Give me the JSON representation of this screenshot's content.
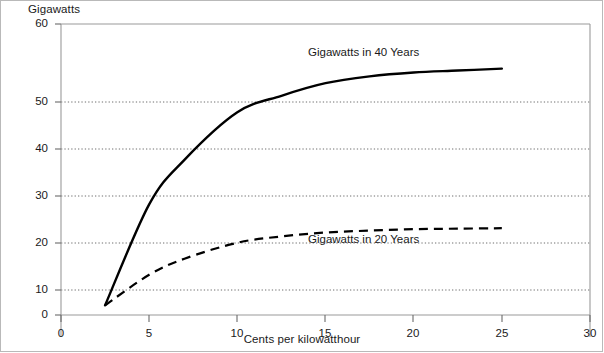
{
  "chart_data": {
    "type": "line",
    "title": "",
    "subtitle": "",
    "xlabel": "Cents per kilowatthour",
    "ylabel": "Gigawatts",
    "xlim": [
      0,
      30
    ],
    "ylim": [
      0,
      60
    ],
    "xticks": [
      0,
      5,
      10,
      15,
      20,
      25,
      30
    ],
    "yticks": [
      0,
      10,
      20,
      30,
      40,
      50,
      60
    ],
    "xtick_labels": [
      "0",
      "5",
      "10",
      "15",
      "20",
      "25",
      "30"
    ],
    "ytick_labels": [
      "0",
      "10",
      "20",
      "30",
      "40",
      "50",
      "60"
    ],
    "grid": "horizontal-dotted",
    "legend": "inline-annotations",
    "series": [
      {
        "name": "Gigawatts in 40 Years",
        "style": "solid",
        "color": "#000000",
        "x": [
          2.5,
          5,
          7,
          10,
          12.5,
          15,
          17.5,
          20,
          22.5,
          25
        ],
        "y": [
          2.0,
          22.8,
          32.0,
          41.8,
          45.2,
          47.8,
          49.2,
          50.0,
          50.4,
          50.8
        ]
      },
      {
        "name": "Gigawatts in 20 Years",
        "style": "dashed",
        "color": "#000000",
        "x": [
          2.5,
          5,
          7,
          10,
          12.5,
          15,
          17.5,
          20,
          22.5,
          25
        ],
        "y": [
          2.0,
          8.3,
          11.6,
          14.9,
          16.2,
          17.0,
          17.4,
          17.7,
          17.8,
          17.9
        ]
      }
    ],
    "annotations": [
      {
        "text": "Gigawatts in 40 Years",
        "x": 15.6,
        "y": 54.5
      },
      {
        "text": "Gigawatts in 20 Years",
        "x": 15.6,
        "y": 14.8
      }
    ]
  },
  "axes": {
    "y_axis_title": "Gigawatts",
    "x_axis_title": "Cents per kilowatthour"
  },
  "colors": {
    "line": "#000000",
    "gridline": "#7a7a7a",
    "axis": "#8a8a8a",
    "border": "#b9b9b9",
    "background": "#ffffff"
  }
}
